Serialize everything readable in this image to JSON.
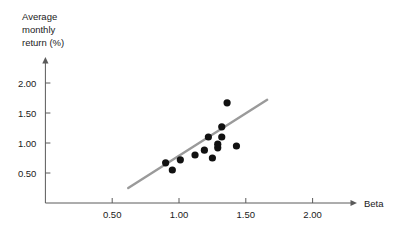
{
  "chart_data": {
    "type": "scatter",
    "title": "",
    "xlabel": "Beta",
    "ylabel": "Average monthly return (%)",
    "ylabel_lines": [
      "Average",
      "monthly",
      "return (%)"
    ],
    "xlim": [
      0,
      2.3
    ],
    "ylim": [
      0,
      2.3
    ],
    "xticks": [
      0.5,
      1.0,
      1.5,
      2.0
    ],
    "xtick_labels": [
      "0.50",
      "1.00",
      "1.50",
      "2.00"
    ],
    "yticks": [
      0.5,
      1.0,
      1.5,
      2.0
    ],
    "ytick_labels": [
      "0.50",
      "1.00",
      "1.50",
      "2.00"
    ],
    "grid": false,
    "legend": null,
    "x": [
      0.9,
      0.95,
      1.01,
      1.12,
      1.19,
      1.22,
      1.25,
      1.29,
      1.29,
      1.32,
      1.32,
      1.36,
      1.43
    ],
    "y": [
      0.67,
      0.55,
      0.72,
      0.8,
      0.88,
      1.1,
      0.75,
      0.92,
      0.98,
      1.1,
      1.27,
      1.67,
      0.95
    ],
    "points": [
      {
        "x": 0.9,
        "y": 0.67
      },
      {
        "x": 0.95,
        "y": 0.55
      },
      {
        "x": 1.01,
        "y": 0.72
      },
      {
        "x": 1.12,
        "y": 0.8
      },
      {
        "x": 1.19,
        "y": 0.88
      },
      {
        "x": 1.22,
        "y": 1.1
      },
      {
        "x": 1.25,
        "y": 0.75
      },
      {
        "x": 1.29,
        "y": 0.92
      },
      {
        "x": 1.29,
        "y": 0.98
      },
      {
        "x": 1.32,
        "y": 1.1
      },
      {
        "x": 1.32,
        "y": 1.27
      },
      {
        "x": 1.36,
        "y": 1.67
      },
      {
        "x": 1.43,
        "y": 0.95
      }
    ],
    "trendline": {
      "x0": 0.62,
      "y0": 0.25,
      "x1": 1.66,
      "y1": 1.72
    },
    "colors": {
      "point": "#111111",
      "trendline": "#9a9a9a",
      "axis": "#5a5a5a",
      "text": "#1a1a1a",
      "background": "#ffffff"
    },
    "marker_radius_px": 3.6
  }
}
